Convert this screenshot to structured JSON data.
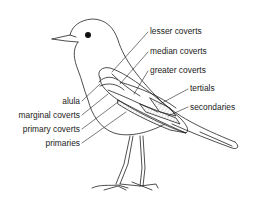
{
  "diagram": {
    "labels_right": [
      {
        "id": "lesser-coverts",
        "text": "lesser coverts"
      },
      {
        "id": "median-coverts",
        "text": "median coverts"
      },
      {
        "id": "greater-coverts",
        "text": "greater coverts"
      },
      {
        "id": "tertials",
        "text": "tertials"
      },
      {
        "id": "secondaries",
        "text": "secondaries"
      }
    ],
    "labels_left": [
      {
        "id": "alula",
        "text": "alula"
      },
      {
        "id": "marginal-coverts",
        "text": "marginal coverts"
      },
      {
        "id": "primary-coverts",
        "text": "primary coverts"
      },
      {
        "id": "primaries",
        "text": "primaries"
      }
    ],
    "colors": {
      "line": "#222222",
      "background": "#ffffff",
      "hatch": "#888888"
    }
  }
}
